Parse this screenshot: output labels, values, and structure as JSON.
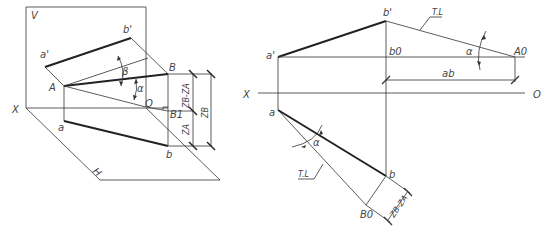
{
  "left_figure": {
    "plane_v": "V",
    "plane_h": "H",
    "axis_x": "X",
    "points": {
      "a_prime": "a'",
      "b_prime": "b'",
      "A": "A",
      "B": "B",
      "O": "O",
      "B1": "B1",
      "a": "a",
      "b": "b"
    },
    "angles": {
      "beta": "β",
      "alpha": "α"
    },
    "dimensions": {
      "zb_minus_za": "ZB-ZA",
      "za": "ZA",
      "zb": "ZB"
    }
  },
  "right_figure": {
    "axis_x": "X",
    "axis_o": "O",
    "points": {
      "a_prime": "a'",
      "b_prime": "b'",
      "b0": "b0",
      "A0": "A0",
      "a": "a",
      "b": "b",
      "B0": "B0"
    },
    "labels": {
      "tl_top": "T.L",
      "tl_bottom": "T.L",
      "ab": "ab",
      "alpha_top": "α",
      "alpha_bottom": "α",
      "zb_minus_za": "ZB-ZA"
    }
  }
}
